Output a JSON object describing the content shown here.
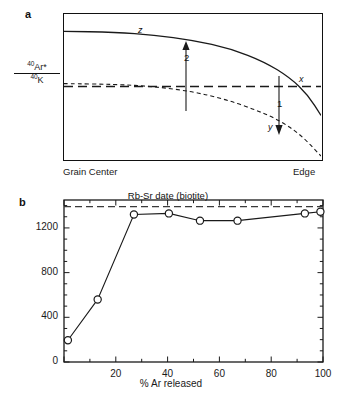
{
  "figure": {
    "panel_a": {
      "letter": "a",
      "y_axis_label_numerator_sup": "40",
      "y_axis_label_numerator": "Ar*",
      "y_axis_label_denominator_sup": "40",
      "y_axis_label_denominator": "K",
      "x_left_label": "Grain Center",
      "x_right_label": "Edge",
      "curve_labels": {
        "z": "z",
        "x": "x",
        "y": "y"
      },
      "arrow_labels": {
        "up": "2",
        "down": "1"
      },
      "curves": {
        "z": {
          "style": "solid",
          "description": "initial 40Ar*/40K profile, flat in grain interior then falling steeply toward the edge",
          "points": [
            [
              0,
              0.88
            ],
            [
              0.2,
              0.875
            ],
            [
              0.35,
              0.855
            ],
            [
              0.5,
              0.82
            ],
            [
              0.65,
              0.76
            ],
            [
              0.78,
              0.67
            ],
            [
              0.88,
              0.56
            ],
            [
              0.95,
              0.44
            ],
            [
              1.0,
              0.3
            ]
          ]
        },
        "x": {
          "style": "dashed",
          "description": "horizontal reference line representing the bulk (whole-grain) ratio",
          "value": 0.5
        },
        "y": {
          "style": "dotted",
          "description": "diffusion-modified profile after argon loss, declining to zero at the grain edge",
          "points": [
            [
              0,
              0.52
            ],
            [
              0.2,
              0.515
            ],
            [
              0.35,
              0.5
            ],
            [
              0.5,
              0.465
            ],
            [
              0.62,
              0.415
            ],
            [
              0.73,
              0.35
            ],
            [
              0.83,
              0.275
            ],
            [
              0.92,
              0.17
            ],
            [
              1.0,
              0.02
            ]
          ]
        }
      }
    },
    "panel_b": {
      "letter": "b",
      "reference_line_label": "Rb-Sr date (biotite)"
    }
  },
  "chart_data": {
    "type": "line",
    "title": "",
    "xlabel": "% Ar released",
    "ylabel": "Age (Ma)",
    "xlim": [
      0,
      100
    ],
    "ylim": [
      0,
      1450
    ],
    "xticks": [
      0,
      20,
      40,
      60,
      80,
      100
    ],
    "xtick_labels": [
      "",
      "20",
      "40",
      "60",
      "80",
      "100"
    ],
    "xticks_minor": [
      10,
      30,
      50,
      70,
      90
    ],
    "yticks": [
      0,
      400,
      800,
      1200
    ],
    "ytick_labels": [
      "0",
      "400",
      "800",
      "1200"
    ],
    "yticks_minor": [
      100,
      200,
      300,
      500,
      600,
      700,
      900,
      1000,
      1100,
      1300,
      1400
    ],
    "grid": false,
    "legend": null,
    "series": [
      {
        "name": "40Ar/39Ar age spectrum",
        "marker": "open-circle",
        "x": [
          1.5,
          13,
          27,
          40.5,
          52.5,
          67,
          93,
          99
        ],
        "values": [
          195,
          560,
          1320,
          1330,
          1265,
          1265,
          1330,
          1345
        ]
      }
    ],
    "reference_lines": [
      {
        "name": "Rb-Sr date (biotite)",
        "orientation": "horizontal",
        "value": 1390,
        "style": "dashed",
        "label": "Rb-Sr date (biotite)"
      }
    ]
  }
}
